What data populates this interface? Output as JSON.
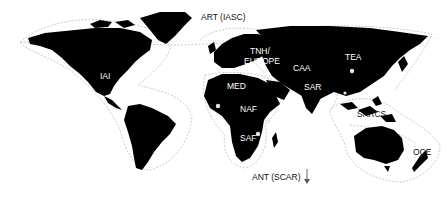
{
  "map": {
    "title": "World regional networks map",
    "colors": {
      "land": "#000000",
      "ocean": "#ffffff",
      "boundary": "#bdbdbd",
      "label_on_land": "#ffffff",
      "label_on_ocean": "#111111"
    },
    "regions": [
      {
        "id": "art",
        "label": "ART (IASC)",
        "x": 253,
        "y": 12,
        "on": "ocean"
      },
      {
        "id": "iai",
        "label": "IAI",
        "x": 100,
        "y": 72,
        "on": "land"
      },
      {
        "id": "tnh",
        "label": "TNH/",
        "x": 250,
        "y": 49,
        "on": "land"
      },
      {
        "id": "europe",
        "label": "EUROPE",
        "x": 243,
        "y": 59,
        "on": "land"
      },
      {
        "id": "caa",
        "label": "CAA",
        "x": 293,
        "y": 64,
        "on": "land"
      },
      {
        "id": "tea",
        "label": "TEA",
        "x": 345,
        "y": 53,
        "on": "land"
      },
      {
        "id": "med",
        "label": "MED",
        "x": 226,
        "y": 82,
        "on": "land"
      },
      {
        "id": "sar",
        "label": "SAR",
        "x": 304,
        "y": 83,
        "on": "land"
      },
      {
        "id": "naf",
        "label": "NAF",
        "x": 240,
        "y": 104,
        "on": "land"
      },
      {
        "id": "sarcs",
        "label": "SARCS",
        "x": 357,
        "y": 110,
        "on": "ocean"
      },
      {
        "id": "saf",
        "label": "SAF",
        "x": 240,
        "y": 134,
        "on": "land"
      },
      {
        "id": "oce",
        "label": "OCE",
        "x": 413,
        "y": 148,
        "on": "ocean"
      },
      {
        "id": "ant",
        "label": "ANT (SCAR)",
        "x": 252,
        "y": 173,
        "on": "ocean"
      }
    ],
    "arrow": {
      "label": "down-arrow",
      "glyph": "↓"
    }
  }
}
